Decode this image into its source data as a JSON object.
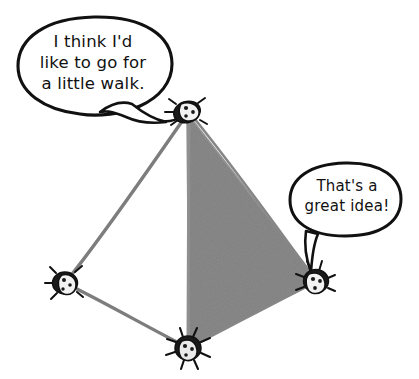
{
  "illustration": {
    "title": "Four bugs on a tetrahedron talking about going for a walk",
    "style": "hand-drawn black ink line art with gray shading",
    "background_color": "#ffffff",
    "ink_color": "#111111",
    "edge_color": "#7d7d7d",
    "shaded_face_color": "#8a8a8a"
  },
  "speech_bubbles": [
    {
      "id": "bubble-top-left",
      "text": "I think I'd\nlike to go for\na little walk.",
      "speaker": "apex-bug",
      "tail_direction": "right",
      "outline_color": "#111111",
      "fill_color": "#ffffff"
    },
    {
      "id": "bubble-right",
      "text": "That's a\ngreat idea!",
      "speaker": "right-bug",
      "tail_direction": "down",
      "outline_color": "#111111",
      "fill_color": "#ffffff"
    }
  ],
  "shape": {
    "name": "tetrahedron",
    "vertices": [
      {
        "name": "apex",
        "label": "apex-bug",
        "x": 187,
        "y": 112
      },
      {
        "name": "left",
        "label": "left-bug",
        "x": 65,
        "y": 283
      },
      {
        "name": "right",
        "label": "right-bug",
        "x": 316,
        "y": 281
      },
      {
        "name": "bottom",
        "label": "bottom-bug",
        "x": 188,
        "y": 348
      }
    ],
    "edges": [
      {
        "from": "apex",
        "to": "left"
      },
      {
        "from": "apex",
        "to": "bottom"
      },
      {
        "from": "apex",
        "to": "right"
      },
      {
        "from": "left",
        "to": "bottom"
      },
      {
        "from": "bottom",
        "to": "right"
      }
    ],
    "shaded_face": {
      "vertices": [
        "apex",
        "right",
        "bottom"
      ],
      "color": "#8a8a8a"
    }
  },
  "bugs": [
    {
      "id": "apex-bug",
      "x": 187,
      "y": 112,
      "size": 19,
      "has_antennae": true,
      "spots": 3
    },
    {
      "id": "left-bug",
      "x": 65,
      "y": 283,
      "size": 17,
      "has_antennae": true,
      "spots": 3
    },
    {
      "id": "right-bug",
      "x": 316,
      "y": 281,
      "size": 17,
      "has_antennae": true,
      "spots": 3
    },
    {
      "id": "bottom-bug",
      "x": 188,
      "y": 348,
      "size": 18,
      "has_antennae": true,
      "spots": 3
    }
  ]
}
